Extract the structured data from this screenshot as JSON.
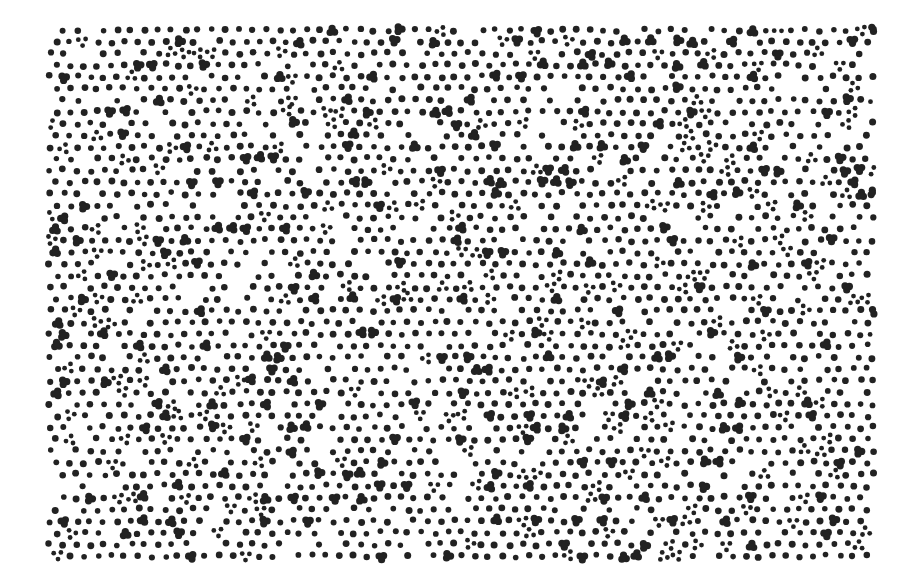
{
  "image": {
    "description": "Quasiperiodic dot pattern with single dots, three-dot clusters and trefoil (three-lobed) blobs",
    "width": 903,
    "height": 581,
    "background": "#ffffff",
    "dot_color": "#222222",
    "pattern_bounds": {
      "x": 46,
      "y": 26,
      "width": 828,
      "height": 538
    },
    "elements": {
      "single_dot_radius": 3.2,
      "cluster_dot_radius": 3.0,
      "trefoil_lobe_radius": 3.6,
      "spacing": 13.5
    },
    "seed": 7
  }
}
